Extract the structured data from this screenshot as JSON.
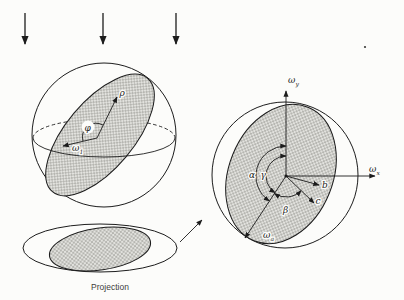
{
  "colors": {
    "ink": "#1c1c1c",
    "halftone_dot": "#74746f",
    "halftone_bg": "#e2e2de",
    "paper": "#fcfcfa"
  },
  "left_figure": {
    "pole_vector_label": "ρ",
    "dip_angle_label": "φ",
    "omega_1": {
      "base": "ω",
      "sub": "1"
    },
    "caption": "Projection"
  },
  "right_figure": {
    "axis_y": {
      "base": "ω",
      "sub": "y"
    },
    "axis_x": {
      "base": "ω",
      "sub": "x"
    },
    "omega_a": {
      "base": "ω",
      "sub": "a"
    },
    "angle_alpha": "α",
    "angle_gamma": "γ",
    "angle_beta": "β",
    "axis_b": "b",
    "axis_c": "c"
  }
}
